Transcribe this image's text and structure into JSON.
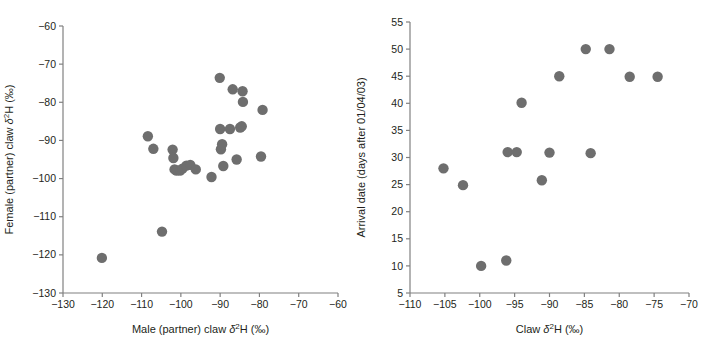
{
  "figure": {
    "background": "#ffffff",
    "marker_color": "#6e6e6e",
    "axis_color": "#808080",
    "text_color": "#231f20",
    "caption_partial": ""
  },
  "chart_data": [
    {
      "id": "panel-left",
      "type": "scatter",
      "title": "",
      "xlabel": "Male (partner) claw δ²H (‰)",
      "ylabel": "Female (partner) claw δ²H (‰)",
      "xlim": [
        -130,
        -60
      ],
      "ylim": [
        -130,
        -60
      ],
      "xticks": [
        -130,
        -120,
        -110,
        -100,
        -90,
        -80,
        -70,
        -60
      ],
      "yticks": [
        -130,
        -120,
        -110,
        -100,
        -90,
        -80,
        -70,
        -60
      ],
      "xticklabels": [
        "−130",
        "−120",
        "−110",
        "−100",
        "−90",
        "−80",
        "−70",
        "−60"
      ],
      "yticklabels": [
        "−130",
        "−120",
        "−110",
        "−100",
        "−90",
        "−80",
        "−70",
        "−60"
      ],
      "grid": false,
      "legend": null,
      "marker_size": 5.2,
      "points": [
        {
          "x": -120.1,
          "y": -120.8
        },
        {
          "x": -104.8,
          "y": -113.9
        },
        {
          "x": -108.4,
          "y": -88.9
        },
        {
          "x": -107.0,
          "y": -92.2
        },
        {
          "x": -102.1,
          "y": -92.4
        },
        {
          "x": -101.9,
          "y": -94.6
        },
        {
          "x": -101.6,
          "y": -97.6
        },
        {
          "x": -101.1,
          "y": -97.9
        },
        {
          "x": -100.2,
          "y": -97.9
        },
        {
          "x": -99.6,
          "y": -97.4
        },
        {
          "x": -98.6,
          "y": -96.6
        },
        {
          "x": -97.6,
          "y": -96.4
        },
        {
          "x": -96.2,
          "y": -97.6
        },
        {
          "x": -92.2,
          "y": -99.6
        },
        {
          "x": -90.1,
          "y": -73.6
        },
        {
          "x": -90.0,
          "y": -87.0
        },
        {
          "x": -89.8,
          "y": -92.3
        },
        {
          "x": -89.5,
          "y": -91.0
        },
        {
          "x": -89.2,
          "y": -96.7
        },
        {
          "x": -87.5,
          "y": -87.0
        },
        {
          "x": -86.8,
          "y": -76.6
        },
        {
          "x": -85.8,
          "y": -95.0
        },
        {
          "x": -84.9,
          "y": -86.6
        },
        {
          "x": -84.5,
          "y": -86.3
        },
        {
          "x": -84.3,
          "y": -77.1
        },
        {
          "x": -84.2,
          "y": -79.9
        },
        {
          "x": -79.2,
          "y": -82.0
        },
        {
          "x": -79.6,
          "y": -94.2
        }
      ]
    },
    {
      "id": "panel-right",
      "type": "scatter",
      "title": "",
      "xlabel": "Claw δ²H (‰)",
      "ylabel": "Arrival date (days after 01/04/03)",
      "xlim": [
        -110,
        -70
      ],
      "ylim": [
        5,
        55
      ],
      "xticks": [
        -110,
        -105,
        -100,
        -95,
        -90,
        -85,
        -80,
        -75,
        -70
      ],
      "yticks": [
        5,
        10,
        15,
        20,
        25,
        30,
        35,
        40,
        45,
        50,
        55
      ],
      "xticklabels": [
        "−110",
        "−105",
        "−100",
        "−95",
        "−90",
        "−85",
        "−80",
        "−75",
        "−70"
      ],
      "yticklabels": [
        "5",
        "10",
        "15",
        "20",
        "25",
        "30",
        "35",
        "40",
        "45",
        "50",
        "55"
      ],
      "grid": false,
      "legend": null,
      "marker_size": 5.2,
      "points": [
        {
          "x": -105.2,
          "y": 28.0
        },
        {
          "x": -102.4,
          "y": 24.9
        },
        {
          "x": -99.8,
          "y": 10.0
        },
        {
          "x": -96.2,
          "y": 11.0
        },
        {
          "x": -96.0,
          "y": 31.0
        },
        {
          "x": -94.7,
          "y": 31.0
        },
        {
          "x": -94.0,
          "y": 40.1
        },
        {
          "x": -91.1,
          "y": 25.8
        },
        {
          "x": -90.0,
          "y": 30.9
        },
        {
          "x": -88.6,
          "y": 45.0
        },
        {
          "x": -84.8,
          "y": 50.0
        },
        {
          "x": -84.1,
          "y": 30.8
        },
        {
          "x": -81.4,
          "y": 50.0
        },
        {
          "x": -78.5,
          "y": 44.9
        },
        {
          "x": -74.5,
          "y": 44.9
        }
      ]
    }
  ]
}
